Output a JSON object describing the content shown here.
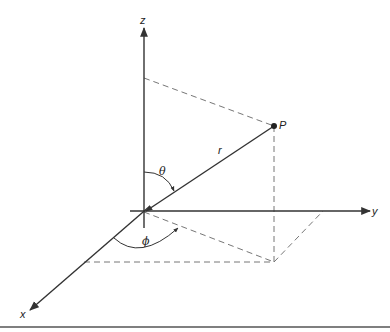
{
  "figure": {
    "type": "spherical-coordinates-diagram",
    "labels": {
      "z_axis": "z",
      "y_axis": "y",
      "x_axis": "x",
      "point": "P",
      "radius": "r",
      "polar_angle": "θ",
      "azimuthal_angle": "ϕ"
    },
    "colors": {
      "line": "#333333",
      "dashed": "#777777",
      "background": "#ffffff"
    }
  }
}
